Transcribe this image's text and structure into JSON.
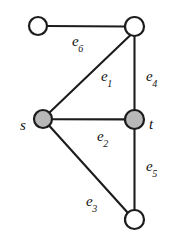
{
  "figure": {
    "width": 173,
    "height": 246,
    "background_color": "#ffffff",
    "stroke_color": "#1c1c1c",
    "filled_vertex_color": "#b8b8b8",
    "open_vertex_color": "#ffffff"
  },
  "graph": {
    "vertices": [
      {
        "id": "v_topleft",
        "label": "",
        "cx": 38,
        "cy": 26,
        "r": 9,
        "style": "open"
      },
      {
        "id": "v_topright",
        "label": "",
        "cx": 134.5,
        "cy": 26.5,
        "r": 9.5,
        "style": "open"
      },
      {
        "id": "v_s",
        "label": "s",
        "cx": 43,
        "cy": 119,
        "r": 9,
        "style": "filled",
        "label_x": 23,
        "label_y": 125
      },
      {
        "id": "v_t",
        "label": "t",
        "cx": 134.5,
        "cy": 119.5,
        "r": 9.5,
        "style": "filled",
        "label_x": 151,
        "label_y": 124
      },
      {
        "id": "v_bottom",
        "label": "",
        "cx": 134.5,
        "cy": 219.5,
        "r": 9.5,
        "style": "open"
      }
    ],
    "edges": [
      {
        "id": "e6",
        "label": "e",
        "subscript": "6",
        "from": "v_topleft",
        "to": "v_topright",
        "x1": 47,
        "y1": 26,
        "x2": 125,
        "y2": 26.5,
        "label_x": 78,
        "label_y": 43
      },
      {
        "id": "e1",
        "label": "e",
        "subscript": "1",
        "from": "v_s",
        "to": "v_topright",
        "x1": 49.5,
        "y1": 112.5,
        "x2": 130,
        "y2": 35.5,
        "label_x": 107,
        "label_y": 78
      },
      {
        "id": "e4",
        "label": "e",
        "subscript": "4",
        "from": "v_topright",
        "to": "v_t",
        "x1": 134.5,
        "y1": 36,
        "x2": 134.5,
        "y2": 110,
        "label_x": 152,
        "label_y": 78
      },
      {
        "id": "e2",
        "label": "e",
        "subscript": "2",
        "from": "v_s",
        "to": "v_t",
        "x1": 52,
        "y1": 119.2,
        "x2": 125,
        "y2": 119.4,
        "label_x": 103,
        "label_y": 138
      },
      {
        "id": "e5",
        "label": "e",
        "subscript": "5",
        "from": "v_t",
        "to": "v_bottom",
        "x1": 134.5,
        "y1": 129,
        "x2": 134.5,
        "y2": 210,
        "label_x": 152,
        "label_y": 168
      },
      {
        "id": "e3",
        "label": "e",
        "subscript": "3",
        "from": "v_s",
        "to": "v_bottom",
        "x1": 49.5,
        "y1": 126,
        "x2": 128,
        "y2": 213,
        "label_x": 92,
        "label_y": 203
      }
    ]
  }
}
